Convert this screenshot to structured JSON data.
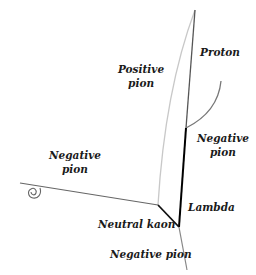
{
  "labels": {
    "proton": "Proton",
    "positive_pion_1": "Positive",
    "positive_pion_2": "pion",
    "negative_pion_right_1": "Negative",
    "negative_pion_right_2": "pion",
    "negative_pion_left_1": "Negative",
    "negative_pion_left_2": "pion",
    "lambda": "Lambda",
    "neutral_kaon": "Neutral kaon",
    "negative_pion_bottom": "Negative pion"
  },
  "tracks": [
    {
      "name": "proton",
      "color": "#555555"
    },
    {
      "name": "positive-pion",
      "color": "#c8c8c8"
    },
    {
      "name": "negative-pion-curve",
      "color": "#777777"
    },
    {
      "name": "lambda",
      "color": "#000000"
    },
    {
      "name": "neutral-kaon",
      "color": "#111111"
    },
    {
      "name": "negative-pion-bottom",
      "color": "#888888"
    },
    {
      "name": "negative-pion-left",
      "color": "#666666"
    }
  ]
}
